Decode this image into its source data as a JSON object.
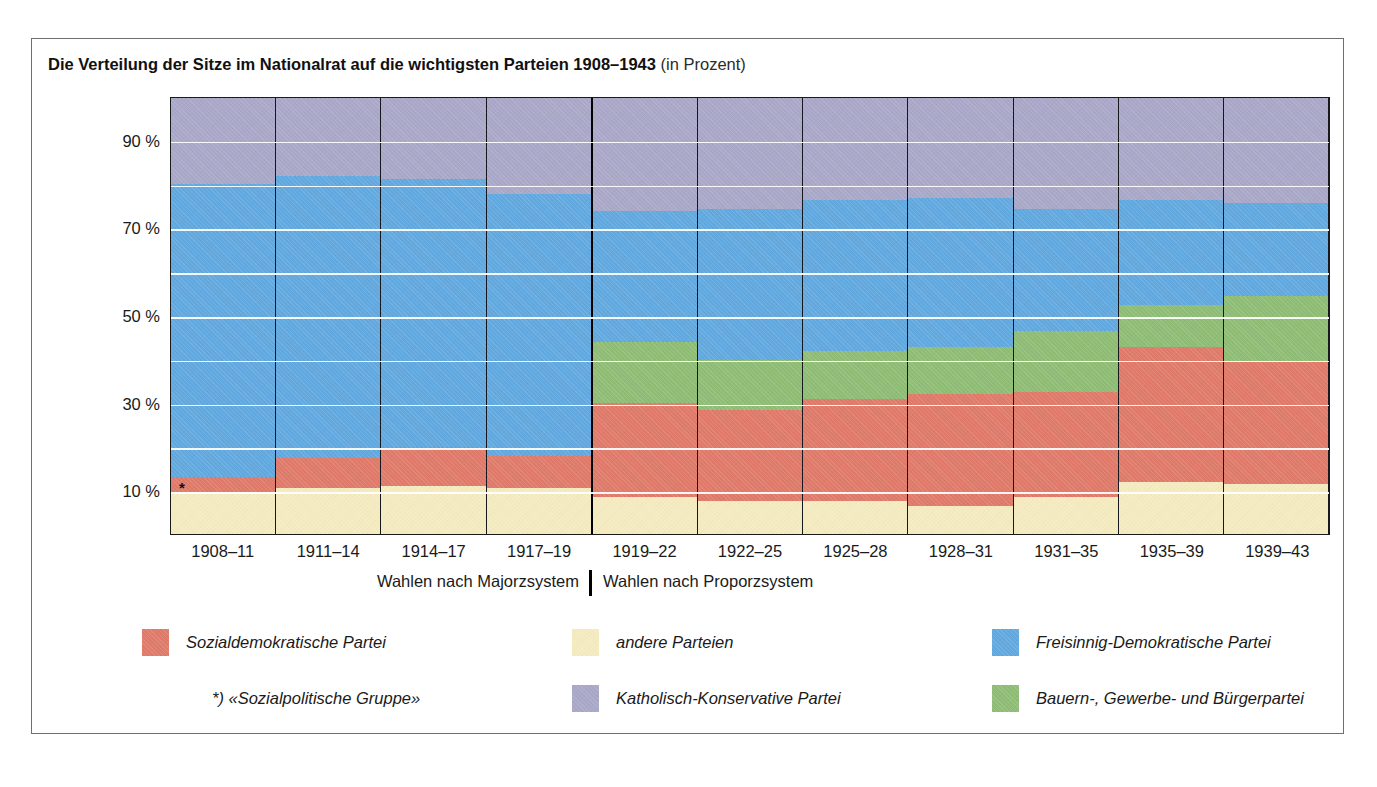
{
  "page_bleed": {
    "left_fragment": "",
    "right_fragment": ""
  },
  "figure": {
    "title_main": "Die Verteilung der Sitze im Nationalrat auf die wichtigsten Parteien 1908–1943",
    "title_sub": "(in Prozent)",
    "asterisk_marker": "*",
    "system_captions": {
      "left": "Wahlen nach Majorzsystem",
      "right": "Wahlen nach Proporzsystem"
    },
    "footnote": "*) «Sozialpolitische Gruppe»"
  },
  "legend": {
    "items": [
      {
        "label": "Sozialdemokratische Partei",
        "color": "#e07a6a",
        "key": "spd"
      },
      {
        "label": "andere Parteien",
        "color": "#f5ebc0",
        "key": "andere"
      },
      {
        "label": "Freisinnig-Demokratische Partei",
        "color": "#62a9e0",
        "key": "fdp"
      },
      {
        "label": "Katholisch-Konservative Partei",
        "color": "#a9a8c8",
        "key": "kk"
      },
      {
        "label": "Bauern-, Gewerbe- und Bürgerpartei",
        "color": "#8fbd75",
        "key": "bgb"
      }
    ]
  },
  "chart_data": {
    "type": "bar",
    "stacked": true,
    "title": "Die Verteilung der Sitze im Nationalrat auf die wichtigsten Parteien 1908–1943 (in Prozent)",
    "xlabel": "",
    "ylabel": "",
    "ylim": [
      0,
      100
    ],
    "ytick_labels": [
      "10 %",
      "30 %",
      "50 %",
      "70 %",
      "90 %"
    ],
    "ytick_values": [
      10,
      30,
      50,
      70,
      90
    ],
    "gridline_values": [
      10,
      20,
      30,
      40,
      50,
      60,
      70,
      80,
      90
    ],
    "grid": true,
    "legend_position": "below",
    "categories": [
      "1908–11",
      "1911–14",
      "1914–17",
      "1917–19",
      "1919–22",
      "1922–25",
      "1925–28",
      "1928–31",
      "1931–35",
      "1935–39",
      "1939–43"
    ],
    "electoral_system": [
      "Majorz",
      "Majorz",
      "Majorz",
      "Majorz",
      "Proporz",
      "Proporz",
      "Proporz",
      "Proporz",
      "Proporz",
      "Proporz",
      "Proporz"
    ],
    "system_divider_after_index": 3,
    "stack_order_bottom_to_top": [
      "andere",
      "spd",
      "bgb",
      "fdp",
      "kk"
    ],
    "series": [
      {
        "name": "andere Parteien",
        "key": "andere",
        "color": "#f5ebc0",
        "values": [
          9.5,
          10.5,
          11.0,
          10.5,
          8.5,
          7.5,
          7.5,
          6.5,
          8.5,
          12.0,
          11.5
        ]
      },
      {
        "name": "Sozialdemokratische Partei",
        "key": "spd",
        "color": "#e07a6a",
        "values": [
          3.5,
          7.0,
          9.0,
          7.5,
          21.5,
          21.0,
          23.5,
          25.5,
          24.0,
          31.0,
          28.0
        ]
      },
      {
        "name": "Bauern-, Gewerbe- und Bürgerpartei",
        "key": "bgb",
        "color": "#8fbd75",
        "values": [
          0,
          0,
          0,
          0,
          14.0,
          11.5,
          11.0,
          11.0,
          14.0,
          9.5,
          15.0
        ]
      },
      {
        "name": "Freisinnig-Demokratische Partei",
        "key": "fdp",
        "color": "#62a9e0",
        "values": [
          67.0,
          64.5,
          61.5,
          60.0,
          30.0,
          34.5,
          34.5,
          34.0,
          28.0,
          24.0,
          21.5
        ]
      },
      {
        "name": "Katholisch-Konservative Partei",
        "key": "kk",
        "color": "#a9a8c8",
        "values": [
          19.5,
          18.0,
          18.5,
          22.0,
          26.0,
          25.5,
          23.5,
          23.0,
          25.5,
          23.5,
          24.0
        ]
      }
    ]
  }
}
